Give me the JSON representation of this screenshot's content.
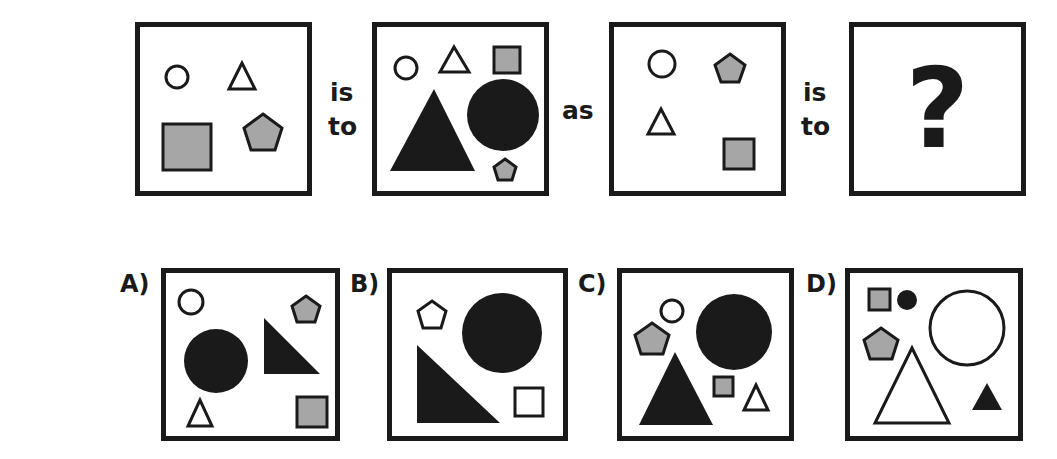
{
  "puzzle": {
    "connectors": {
      "is": "is",
      "to": "to",
      "as": "as"
    },
    "question_mark": "?",
    "options": [
      {
        "label": "A)"
      },
      {
        "label": "B)"
      },
      {
        "label": "C)"
      },
      {
        "label": "D)"
      }
    ]
  },
  "colors": {
    "outline": "#1a1a1a",
    "gray_fill": "#a6a6a6",
    "white": "#ffffff"
  }
}
